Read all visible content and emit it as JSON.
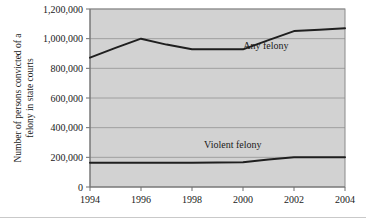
{
  "chart_data": {
    "type": "line",
    "title": "",
    "xlabel": "",
    "ylabel": "Number of persons convicted of a felony in state courts",
    "ylabel_line1": "Number of persons convicted of a",
    "ylabel_line2": "felony in state courts",
    "x": [
      1994,
      1995,
      1996,
      1997,
      1998,
      1999,
      2000,
      2001,
      2002,
      2003,
      2004
    ],
    "xtick_labels": [
      "1994",
      "1996",
      "1998",
      "2000",
      "2002",
      "2004"
    ],
    "xticks": [
      1994,
      1996,
      1998,
      2000,
      2002,
      2004
    ],
    "xlim": [
      1994,
      2004
    ],
    "ylim": [
      0,
      1200000
    ],
    "yticks": [
      0,
      200000,
      400000,
      600000,
      800000,
      1000000,
      1200000
    ],
    "ytick_labels": [
      "0",
      "200,000",
      "400,000",
      "600,000",
      "800,000",
      "1,000,000",
      "1,200,000"
    ],
    "grid": true,
    "legend_position": "inline-annotation",
    "series": [
      {
        "name": "Any felony",
        "label_x": 2000.9,
        "label_y": 930000,
        "values": [
          872000,
          938000,
          1000000,
          960000,
          928000,
          928000,
          928000,
          990000,
          1051000,
          1060000,
          1070000
        ]
      },
      {
        "name": "Violent felony",
        "label_x": 1999.6,
        "label_y": 262000,
        "values": [
          163000,
          163000,
          163000,
          163000,
          163000,
          165000,
          167000,
          185000,
          200000,
          201000,
          201000
        ]
      }
    ],
    "annotations": [
      {
        "text": "Any felony",
        "series": "Any felony"
      },
      {
        "text": "Violent felony",
        "series": "Violent felony"
      }
    ],
    "colors": {
      "plot_background": "#d2d2d2",
      "line": "#1f1f1f",
      "gridline": "#9a9a9a",
      "frame": "#8a8a8a",
      "text": "#1a1a1a",
      "page_background": "#ffffff"
    }
  }
}
